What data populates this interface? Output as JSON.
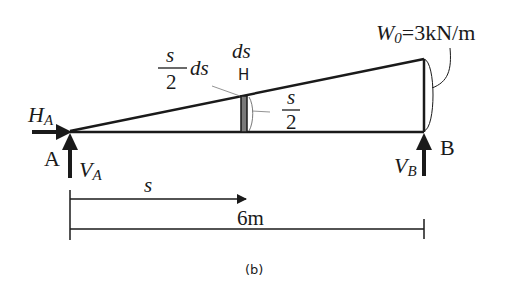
{
  "diagram": {
    "labels": {
      "HA_main": "H",
      "HA_sub": "A",
      "A": "A",
      "VA_main": "V",
      "VA_sub": "A",
      "B": "B",
      "VB_main": "V",
      "VB_sub": "B",
      "W0_main": "W",
      "W0_sub": "0",
      "W0_value": "=3kN/m",
      "frac_left_num": "s",
      "frac_left_den": "2",
      "frac_left_ds": "ds",
      "ds_top": "ds",
      "strip_marker": "H",
      "frac_right_num": "s",
      "frac_right_den": "2",
      "s_dim": "s",
      "span_dim": "6m",
      "caption": "(b)"
    },
    "colors": {
      "line": "#1a1a1a",
      "strip_fill": "#7a7a7a",
      "background": "#ffffff"
    }
  }
}
